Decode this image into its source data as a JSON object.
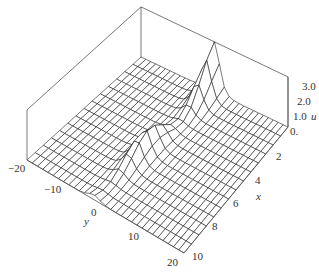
{
  "chart_data": {
    "type": "surface3d",
    "title": "",
    "axes": {
      "x": {
        "label": "x",
        "range": [
          0,
          10
        ],
        "ticks": [
          "2",
          "4",
          "6",
          "8",
          "10"
        ]
      },
      "y": {
        "label": "y",
        "range": [
          -20,
          20
        ],
        "ticks": [
          "-20",
          "-10",
          "0",
          "10",
          "20"
        ]
      },
      "u": {
        "label": "u",
        "range": [
          0,
          3
        ],
        "ticks": [
          "0.",
          "1.0",
          "2.0",
          "3.0"
        ]
      }
    },
    "surface": {
      "description": "Localized ridge along y near 0 whose amplitude oscillates/decays with x (breather-like soliton)",
      "peak_value": 3.0,
      "peak_location": {
        "x": 0,
        "y": 0
      },
      "ridge_center_y_at_x0": 0,
      "ridge_center_y_at_x10": -3,
      "grid_x_lines": 14,
      "grid_y_lines": 30
    },
    "grid": false,
    "box": true,
    "colors": {
      "mesh_line": "#222222",
      "mesh_fill": "#ffffff",
      "box": "#555555",
      "text": "#333333"
    }
  },
  "labels": {
    "x_axis": "x",
    "y_axis": "y",
    "u_axis": "u",
    "x_ticks": [
      {
        "text": "2",
        "x": 276,
        "y": 160
      },
      {
        "text": "4",
        "x": 255,
        "y": 184
      },
      {
        "text": "6",
        "x": 233,
        "y": 207
      },
      {
        "text": "8",
        "x": 212,
        "y": 230
      },
      {
        "text": "10",
        "x": 192,
        "y": 260
      }
    ],
    "y_ticks": [
      {
        "text": "-20",
        "x": 8,
        "y": 172
      },
      {
        "text": "-10",
        "x": 44,
        "y": 193
      },
      {
        "text": "0",
        "x": 91,
        "y": 216
      },
      {
        "text": "10",
        "x": 128,
        "y": 240
      },
      {
        "text": "20",
        "x": 167,
        "y": 266
      }
    ],
    "u_ticks": [
      {
        "text": "3.0",
        "x": 302,
        "y": 90
      },
      {
        "text": "2.0",
        "x": 297,
        "y": 105
      },
      {
        "text": "1.0",
        "x": 293,
        "y": 120
      },
      {
        "text": "0.",
        "x": 290,
        "y": 135
      }
    ],
    "x_label_pos": {
      "x": 256,
      "y": 200
    },
    "y_label_pos": {
      "x": 84,
      "y": 225
    },
    "u_label_pos": {
      "x": 311,
      "y": 120
    }
  }
}
